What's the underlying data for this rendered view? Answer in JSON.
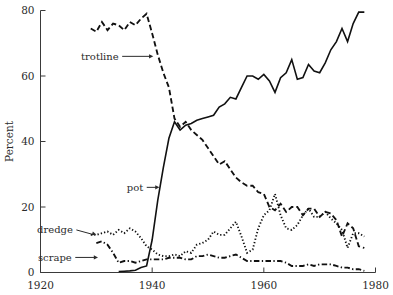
{
  "chart_data": {
    "type": "line",
    "title": "",
    "xlabel": "",
    "ylabel": "Percent",
    "xlim": [
      1920,
      1980
    ],
    "ylim": [
      0,
      80
    ],
    "xticks": [
      1920,
      1940,
      1960,
      1980
    ],
    "yticks": [
      0,
      20,
      40,
      60,
      80
    ],
    "xtick_labels": [
      "1920",
      "1940",
      "1960",
      "1980"
    ],
    "ytick_labels": [
      "0",
      "20",
      "40",
      "60",
      "80"
    ],
    "grid": false,
    "legend": "inline-annotations",
    "annotations": [
      {
        "label": "trotline",
        "x": 1934.0,
        "y": 66.0,
        "arrow": "right",
        "points_to": [
          1940.2,
          66.0
        ]
      },
      {
        "label": "pot",
        "x": 1938.4,
        "y": 26.0,
        "arrow": "right",
        "points_to": [
          1941.3,
          26.0
        ]
      },
      {
        "label": "dredge",
        "x": 1925.8,
        "y": 13.0,
        "arrow": "down-right",
        "points_to": [
          1930.0,
          11.6
        ]
      },
      {
        "label": "scrape",
        "x": 1925.6,
        "y": 4.6,
        "arrow": "right",
        "points_to": [
          1930.3,
          4.6
        ]
      }
    ],
    "series": [
      {
        "name": "trotline",
        "style": "dashed",
        "x": [
          1929,
          1930,
          1931,
          1932,
          1933,
          1934,
          1935,
          1936,
          1937,
          1938,
          1939,
          1940,
          1941,
          1942,
          1943,
          1944,
          1945,
          1946,
          1947,
          1948,
          1949,
          1950,
          1951,
          1952,
          1953,
          1954,
          1955,
          1956,
          1957,
          1958,
          1959,
          1960,
          1961,
          1962,
          1963,
          1964,
          1965,
          1966,
          1967,
          1968,
          1969,
          1970,
          1971,
          1972,
          1973,
          1974,
          1975,
          1976,
          1977,
          1978
        ],
        "values": [
          74.5,
          73.5,
          76.5,
          74.0,
          76.0,
          75.5,
          74.0,
          76.5,
          75.5,
          77.5,
          79.0,
          73.0,
          66.5,
          61.0,
          56.5,
          47.0,
          44.5,
          46.0,
          43.5,
          42.0,
          40.5,
          38.0,
          35.5,
          33.0,
          34.0,
          31.5,
          29.0,
          27.5,
          26.5,
          26.5,
          24.5,
          24.0,
          20.0,
          19.0,
          21.0,
          18.5,
          20.0,
          20.0,
          17.5,
          19.5,
          19.5,
          17.0,
          18.5,
          18.0,
          16.0,
          11.0,
          15.0,
          13.5,
          8.0,
          7.5
        ]
      },
      {
        "name": "pot",
        "style": "solid",
        "x": [
          1934,
          1935,
          1936,
          1937,
          1938,
          1939,
          1940,
          1941,
          1942,
          1943,
          1944,
          1945,
          1946,
          1947,
          1948,
          1949,
          1950,
          1951,
          1952,
          1953,
          1954,
          1955,
          1956,
          1957,
          1958,
          1959,
          1960,
          1961,
          1962,
          1963,
          1964,
          1965,
          1966,
          1967,
          1968,
          1969,
          1970,
          1971,
          1972,
          1973,
          1974,
          1975,
          1976,
          1977,
          1978
        ],
        "values": [
          0.3,
          0.4,
          0.5,
          0.7,
          1.5,
          2.0,
          10.0,
          22.0,
          32.0,
          41.0,
          46.0,
          43.5,
          45.0,
          45.5,
          46.5,
          47.0,
          47.5,
          48.0,
          50.5,
          51.5,
          53.5,
          53.0,
          56.5,
          60.0,
          60.0,
          59.0,
          60.5,
          58.5,
          55.0,
          59.5,
          61.0,
          65.0,
          59.0,
          59.5,
          63.5,
          61.5,
          61.0,
          64.0,
          68.0,
          70.5,
          74.5,
          70.5,
          76.0,
          79.5,
          79.5
        ]
      },
      {
        "name": "dredge",
        "style": "dotted",
        "x": [
          1929,
          1930,
          1931,
          1932,
          1933,
          1934,
          1935,
          1936,
          1937,
          1938,
          1939,
          1940,
          1941,
          1942,
          1943,
          1944,
          1945,
          1946,
          1947,
          1948,
          1949,
          1950,
          1951,
          1952,
          1953,
          1954,
          1955,
          1956,
          1957,
          1958,
          1959,
          1960,
          1961,
          1962,
          1963,
          1964,
          1965,
          1966,
          1967,
          1968,
          1969,
          1970,
          1971,
          1972,
          1973,
          1974,
          1975,
          1976,
          1977,
          1978
        ],
        "values": [
          11.5,
          11.5,
          12.0,
          12.5,
          11.5,
          13.0,
          12.0,
          13.5,
          12.5,
          10.5,
          8.0,
          7.0,
          5.5,
          5.0,
          5.0,
          5.5,
          5.0,
          6.5,
          6.0,
          8.5,
          9.0,
          10.0,
          12.5,
          11.5,
          11.5,
          13.5,
          15.5,
          11.0,
          6.0,
          7.0,
          13.5,
          17.5,
          19.0,
          24.0,
          17.5,
          13.5,
          13.0,
          14.5,
          17.5,
          19.5,
          17.0,
          17.0,
          18.5,
          16.5,
          15.0,
          13.0,
          7.5,
          12.0,
          12.0,
          11.0
        ]
      },
      {
        "name": "scrape",
        "style": "dash-dot",
        "x": [
          1930,
          1931,
          1932,
          1933,
          1934,
          1935,
          1936,
          1937,
          1938,
          1939,
          1940,
          1941,
          1942,
          1943,
          1944,
          1945,
          1946,
          1947,
          1948,
          1949,
          1950,
          1951,
          1952,
          1953,
          1954,
          1955,
          1956,
          1957,
          1958,
          1959,
          1960,
          1961,
          1962,
          1963,
          1964,
          1965,
          1966,
          1967,
          1968,
          1969,
          1970,
          1971,
          1972,
          1973,
          1974,
          1975,
          1976,
          1977,
          1978
        ],
        "values": [
          9.0,
          9.5,
          8.5,
          6.0,
          3.0,
          3.5,
          3.5,
          3.0,
          3.5,
          4.0,
          4.0,
          4.0,
          4.0,
          4.5,
          4.5,
          4.5,
          4.0,
          4.0,
          5.0,
          5.0,
          5.5,
          5.0,
          4.5,
          4.5,
          5.0,
          5.5,
          4.5,
          3.5,
          3.5,
          3.5,
          3.5,
          3.5,
          3.5,
          3.5,
          3.0,
          2.0,
          2.0,
          2.0,
          2.5,
          2.0,
          2.5,
          2.5,
          2.5,
          2.0,
          1.5,
          1.5,
          1.0,
          1.0,
          0.5
        ]
      }
    ]
  },
  "colors": {
    "ink": "#111111",
    "axis": "#3a3a3a",
    "background": "#ffffff"
  }
}
